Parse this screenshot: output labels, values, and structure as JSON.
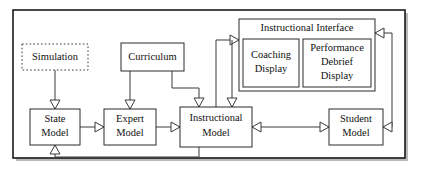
{
  "diagram": {
    "type": "block-diagram",
    "title_visible": false,
    "frame": {
      "stroke": "#1a1a1a",
      "shadow": "#b9b9b9"
    },
    "nodes": [
      {
        "id": "simulation",
        "label": "Simulation",
        "style": "dashed",
        "x": 22,
        "y": 44,
        "w": 66,
        "h": 26
      },
      {
        "id": "curriculum",
        "label": "Curriculum",
        "style": "solid",
        "x": 121,
        "y": 43,
        "w": 63,
        "h": 28
      },
      {
        "id": "state-model",
        "label_line1": "State",
        "label_line2": "Model",
        "style": "solid",
        "x": 30,
        "y": 109,
        "w": 50,
        "h": 36
      },
      {
        "id": "expert-model",
        "label_line1": "Expert",
        "label_line2": "Model",
        "style": "solid",
        "x": 104,
        "y": 109,
        "w": 52,
        "h": 36
      },
      {
        "id": "instructional-model",
        "label_line1": "Instructional",
        "label_line2": "Model",
        "style": "solid",
        "x": 180,
        "y": 107,
        "w": 72,
        "h": 40
      },
      {
        "id": "student-model",
        "label_line1": "Student",
        "label_line2": "Model",
        "style": "solid",
        "x": 329,
        "y": 109,
        "w": 54,
        "h": 36
      }
    ],
    "panel": {
      "id": "instructional-interface",
      "title": "Instructional Interface",
      "x": 239,
      "y": 19,
      "w": 136,
      "h": 72,
      "children": [
        {
          "id": "coaching-display",
          "label_line1": "Coaching",
          "label_line2": "Display",
          "x": 243,
          "y": 39,
          "w": 56,
          "h": 48
        },
        {
          "id": "performance-debrief-display",
          "label_line1": "Performance",
          "label_line2": "Debrief",
          "label_line3": "Display",
          "x": 303,
          "y": 39,
          "w": 68,
          "h": 48
        }
      ]
    },
    "connections": [
      {
        "id": "simulation-to-state-model",
        "from": "simulation",
        "to": "state-model",
        "arrow": "down"
      },
      {
        "id": "curriculum-to-expert-model",
        "from": "curriculum",
        "to": "expert-model",
        "arrow": "down"
      },
      {
        "id": "curriculum-to-instructional-model",
        "from": "curriculum",
        "to": "instructional-model",
        "arrow": "down"
      },
      {
        "id": "state-model-to-expert-model",
        "from": "state-model",
        "to": "expert-model",
        "arrow": "right"
      },
      {
        "id": "expert-model-to-instructional-model",
        "from": "expert-model",
        "to": "instructional-model",
        "arrow": "right"
      },
      {
        "id": "instructional-model-to-interface",
        "from": "instructional-model",
        "to": "instructional-interface",
        "arrow": "right"
      },
      {
        "id": "interface-to-instructional-model",
        "from": "instructional-interface",
        "to": "instructional-model",
        "arrow": "down"
      },
      {
        "id": "student-model-to-instructional-model",
        "from": "student-model",
        "to": "instructional-model",
        "arrow": "left"
      },
      {
        "id": "instructional-model-to-student-model",
        "from": "instructional-model",
        "to": "student-model",
        "arrow": "right"
      },
      {
        "id": "student-model-to-interface",
        "from": "student-model",
        "to": "instructional-interface",
        "arrow": "left-up"
      },
      {
        "id": "instructional-model-to-state-model",
        "from": "instructional-model",
        "to": "state-model",
        "arrow": "up"
      }
    ]
  }
}
